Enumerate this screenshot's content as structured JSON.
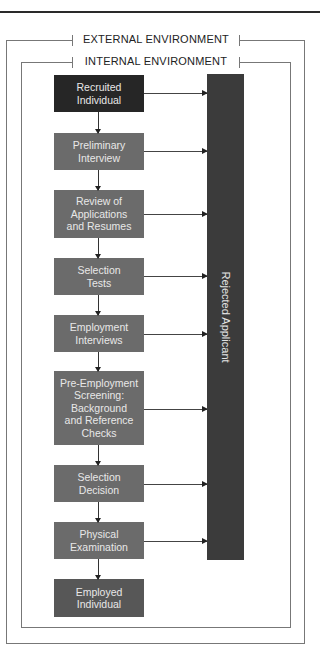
{
  "diagram": {
    "external_label": "EXTERNAL ENVIRONMENT",
    "internal_label": "INTERNAL ENVIRONMENT",
    "rejected_label": "Rejected Applicant",
    "steps": [
      {
        "label": "Recruited\nIndividual",
        "kind": "start"
      },
      {
        "label": "Preliminary\nInterview",
        "kind": "process"
      },
      {
        "label": "Review of\nApplications\nand Resumes",
        "kind": "process"
      },
      {
        "label": "Selection\nTests",
        "kind": "process"
      },
      {
        "label": "Employment\nInterviews",
        "kind": "process"
      },
      {
        "label": "Pre-Employment\nScreening:\nBackground\nand Reference\nChecks",
        "kind": "process"
      },
      {
        "label": "Selection\nDecision",
        "kind": "process"
      },
      {
        "label": "Physical\nExamination",
        "kind": "process"
      },
      {
        "label": "Employed\nIndividual",
        "kind": "end"
      }
    ],
    "colors": {
      "start": "#262626",
      "process": "#6b6b6b",
      "end": "#575757",
      "rejected": "#3b3b3b"
    }
  }
}
